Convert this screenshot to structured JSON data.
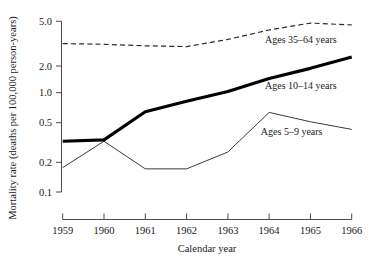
{
  "chart_data": {
    "type": "line",
    "title": "",
    "xlabel": "Calendar year",
    "ylabel": "Mortality rate (deaths per 100,000 person-years)",
    "x": [
      1959,
      1960,
      1961,
      1962,
      1963,
      1964,
      1965,
      1966
    ],
    "xtick_labels": [
      "1959",
      "1960",
      "1961",
      "1962",
      "1963",
      "1964",
      "1965",
      "1966"
    ],
    "xlim": [
      1959,
      1966
    ],
    "yscale": "log",
    "ylim": [
      0.1,
      5.0
    ],
    "ytick_values": [
      0.1,
      0.2,
      0.5,
      1.0,
      2.0,
      5.0
    ],
    "ytick_labels": [
      "0.1",
      "0.2",
      "0.5",
      "1.0",
      "2.0",
      "5.0"
    ],
    "grid": false,
    "legend_position": "inline-annotations",
    "series": [
      {
        "name": "Ages 35-64 years",
        "label": "Ages 35–64 years",
        "style": "dashed",
        "color": "#2b2b2b",
        "values": [
          3.0,
          2.95,
          2.85,
          2.8,
          3.3,
          4.1,
          4.8,
          4.6
        ]
      },
      {
        "name": "Ages 10-14 years",
        "label": "Ages 10–14 years",
        "style": "solid-thick",
        "color": "#000000",
        "values": [
          0.32,
          0.33,
          0.63,
          0.8,
          1.0,
          1.35,
          1.7,
          2.2
        ]
      },
      {
        "name": "Ages 5-9 years",
        "label": "Ages 5–9 years",
        "style": "solid-thin",
        "color": "#3a3a3a",
        "values": [
          0.175,
          0.32,
          0.17,
          0.17,
          0.25,
          0.62,
          0.5,
          0.42
        ]
      }
    ],
    "annotations": [
      {
        "text": "Ages 35–64 years",
        "x": 1963.9,
        "y": 3.05
      },
      {
        "text": "Ages 10–14 years",
        "x": 1963.9,
        "y": 1.05
      },
      {
        "text": "Ages 5–9 years",
        "x": 1963.8,
        "y": 0.37
      }
    ]
  },
  "axes": {
    "y_title": "Mortality rate (deaths per 100,000 person-years)",
    "x_title": "Calendar year"
  }
}
